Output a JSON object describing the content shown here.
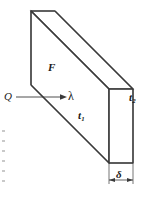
{
  "figure": {
    "type": "engineering-diagram",
    "colors": {
      "stroke": "#3a3a3a",
      "fill": "#ffffff",
      "background": "#ffffff",
      "text": "#1a1a1a"
    },
    "labels": {
      "heat_flow": "Q",
      "conductivity": "λ",
      "area": "F",
      "temp_hot": "t",
      "temp_hot_sub": "1",
      "temp_cold": "t",
      "temp_cold_sub": "2",
      "thickness": "δ"
    },
    "geometry": {
      "front_face": "parallelogram",
      "right_face": "rectangle",
      "top_face": "parallelogram",
      "arrow_direction": "left-to-right",
      "dimension_line": "horizontal-with-end-ticks"
    }
  }
}
